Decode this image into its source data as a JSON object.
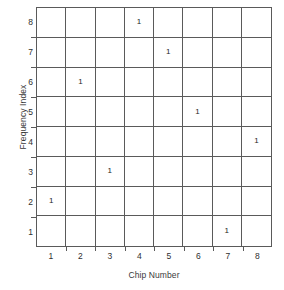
{
  "chart_data": {
    "type": "scatter",
    "title": "",
    "xlabel": "Chip Number",
    "ylabel": "Frequency Index",
    "xticks": [
      "1",
      "2",
      "3",
      "4",
      "5",
      "6",
      "7",
      "8"
    ],
    "yticks": [
      "8",
      "7",
      "6",
      "5",
      "4",
      "3",
      "2",
      "1"
    ],
    "xlim": [
      0.5,
      8.5
    ],
    "ylim": [
      0.5,
      8.5
    ],
    "grid": true,
    "legend": null,
    "marker_label": "1",
    "points": [
      {
        "x": 4,
        "y": 8,
        "label": "1"
      },
      {
        "x": 5,
        "y": 7,
        "label": "1"
      },
      {
        "x": 2,
        "y": 6,
        "label": "1"
      },
      {
        "x": 6,
        "y": 5,
        "label": "1"
      },
      {
        "x": 8,
        "y": 4,
        "label": "1"
      },
      {
        "x": 3,
        "y": 3,
        "label": "1"
      },
      {
        "x": 1,
        "y": 2,
        "label": "1"
      },
      {
        "x": 7,
        "y": 1,
        "label": "1"
      }
    ],
    "colors": {
      "grid_line": "#5a5a5a",
      "text": "#2b2b2b",
      "background": "#ffffff"
    }
  }
}
